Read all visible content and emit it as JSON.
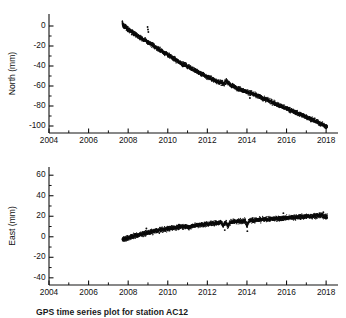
{
  "figure": {
    "caption": "GPS time series plot for station AC12",
    "background": "#ffffff",
    "point_color": "#0d0d0d"
  },
  "chart_data": [
    {
      "type": "scatter",
      "panel_name": "north",
      "title": "",
      "xlabel": "",
      "ylabel": "North (mm)",
      "xlim": [
        2004,
        2018.6
      ],
      "ylim": [
        -107,
        12
      ],
      "grid": false,
      "legend": "none",
      "xticks": [
        2004,
        2006,
        2008,
        2010,
        2012,
        2014,
        2016,
        2018
      ],
      "xtick_labels": [
        "2004",
        "2006",
        "2008",
        "2010",
        "2012",
        "2014",
        "2016",
        "2018"
      ],
      "xminor_ticks": [
        2005,
        2007,
        2009,
        2011,
        2013,
        2015,
        2017
      ],
      "yticks": [
        0,
        -20,
        -40,
        -60,
        -80,
        -100
      ],
      "ytick_labels": [
        "0",
        "-20",
        "-40",
        "-60",
        "-80",
        "-100"
      ],
      "yminor_ticks": [
        -10,
        -30,
        -50,
        -70,
        -90
      ],
      "series": [
        {
          "name": "North displacement",
          "x": [
            2007.7,
            2007.74,
            2007.78,
            2007.82,
            2007.86,
            2007.9,
            2007.94,
            2007.98,
            2008.02,
            2008.1,
            2008.18,
            2008.26,
            2008.34,
            2008.42,
            2008.5,
            2008.58,
            2008.66,
            2008.74,
            2008.82,
            2008.9,
            2008.98,
            2009.06,
            2009.14,
            2009.22,
            2009.3,
            2009.38,
            2009.46,
            2009.54,
            2009.62,
            2009.7,
            2009.78,
            2009.86,
            2009.94,
            2010.02,
            2010.1,
            2010.18,
            2010.26,
            2010.34,
            2010.42,
            2010.5,
            2010.58,
            2010.66,
            2010.74,
            2010.82,
            2010.9,
            2010.98,
            2011.06,
            2011.14,
            2011.22,
            2011.3,
            2011.38,
            2011.46,
            2011.54,
            2011.62,
            2011.7,
            2011.78,
            2011.86,
            2011.94,
            2012.02,
            2012.1,
            2012.18,
            2012.26,
            2012.34,
            2012.42,
            2012.5,
            2012.58,
            2012.66,
            2012.74,
            2012.82,
            2012.9,
            2012.98,
            2013.06,
            2013.14,
            2013.22,
            2013.3,
            2013.38,
            2013.46,
            2013.54,
            2013.62,
            2013.7,
            2013.78,
            2013.86,
            2013.94,
            2014.02,
            2014.1,
            2014.18,
            2014.26,
            2014.34,
            2014.42,
            2014.5,
            2014.58,
            2014.66,
            2014.74,
            2014.82,
            2014.9,
            2014.98,
            2015.06,
            2015.14,
            2015.22,
            2015.3,
            2015.38,
            2015.46,
            2015.54,
            2015.62,
            2015.7,
            2015.78,
            2015.86,
            2015.94,
            2016.02,
            2016.1,
            2016.18,
            2016.26,
            2016.34,
            2016.42,
            2016.5,
            2016.58,
            2016.66,
            2016.74,
            2016.82,
            2016.9,
            2016.98,
            2017.06,
            2017.14,
            2017.22,
            2017.3,
            2017.38,
            2017.46,
            2017.54,
            2017.62,
            2017.7,
            2017.78,
            2017.86,
            2017.94,
            2018.0,
            2018.06
          ],
          "y": [
            3.0,
            1.0,
            0.5,
            -1.0,
            0.0,
            -1.5,
            -2.0,
            -3.0,
            -3.5,
            -5.0,
            -6.0,
            -7.0,
            -8.0,
            -9.0,
            -10.0,
            -11.0,
            -12.0,
            -13.0,
            -14.0,
            -15.0,
            -16.0,
            -17.0,
            -18.0,
            -19.0,
            -20.0,
            -21.0,
            -22.0,
            -23.0,
            -24.0,
            -25.0,
            -26.0,
            -27.0,
            -28.0,
            -29.0,
            -30.0,
            -31.0,
            -32.0,
            -33.0,
            -34.0,
            -35.0,
            -36.0,
            -37.0,
            -38.0,
            -38.5,
            -39.0,
            -40.0,
            -41.0,
            -41.5,
            -42.5,
            -43.5,
            -44.5,
            -45.5,
            -46.0,
            -47.0,
            -48.0,
            -48.5,
            -49.5,
            -50.5,
            -51.0,
            -51.5,
            -52.5,
            -53.0,
            -54.0,
            -54.5,
            -55.5,
            -56.0,
            -56.5,
            -57.0,
            -58.0,
            -56.0,
            -55.0,
            -57.0,
            -58.5,
            -59.5,
            -60.0,
            -61.0,
            -61.5,
            -62.5,
            -63.0,
            -63.5,
            -64.0,
            -65.0,
            -65.5,
            -66.0,
            -66.5,
            -67.0,
            -67.5,
            -68.5,
            -69.0,
            -69.5,
            -70.0,
            -71.0,
            -71.5,
            -72.5,
            -73.0,
            -73.5,
            -74.0,
            -75.0,
            -75.5,
            -76.5,
            -77.0,
            -78.0,
            -78.5,
            -79.5,
            -80.0,
            -80.5,
            -81.5,
            -82.0,
            -82.5,
            -83.0,
            -84.0,
            -84.5,
            -85.5,
            -86.0,
            -86.5,
            -87.5,
            -88.0,
            -88.5,
            -89.5,
            -90.0,
            -90.5,
            -91.5,
            -92.0,
            -93.0,
            -93.5,
            -94.5,
            -95.0,
            -96.0,
            -96.5,
            -97.5,
            -98.0,
            -99.0,
            -100.0,
            -100.5,
            -101.0
          ],
          "scatter_band_mm": 3.0,
          "outliers": [
            {
              "x": 2008.98,
              "y": -1.0
            },
            {
              "x": 2009.0,
              "y": -3.5
            },
            {
              "x": 2009.02,
              "y": -6.0
            },
            {
              "x": 2014.15,
              "y": -72.0
            }
          ]
        }
      ]
    },
    {
      "type": "scatter",
      "panel_name": "east",
      "title": "",
      "xlabel": "",
      "ylabel": "East (mm)",
      "xlim": [
        2004,
        2018.6
      ],
      "ylim": [
        -47,
        68
      ],
      "grid": false,
      "legend": "none",
      "xticks": [
        2004,
        2006,
        2008,
        2010,
        2012,
        2014,
        2016,
        2018
      ],
      "xtick_labels": [
        "2004",
        "2006",
        "2008",
        "2010",
        "2012",
        "2014",
        "2016",
        "2018"
      ],
      "xminor_ticks": [
        2005,
        2007,
        2009,
        2011,
        2013,
        2015,
        2017
      ],
      "yticks": [
        60,
        40,
        20,
        0,
        -20,
        -40
      ],
      "ytick_labels": [
        "60",
        "40",
        "20",
        "0",
        "-20",
        "-40"
      ],
      "yminor_ticks": [
        50,
        30,
        10,
        -10,
        -30
      ],
      "series": [
        {
          "name": "East displacement",
          "x": [
            2007.7,
            2007.76,
            2007.82,
            2007.88,
            2007.94,
            2008.0,
            2008.08,
            2008.16,
            2008.24,
            2008.32,
            2008.4,
            2008.48,
            2008.56,
            2008.64,
            2008.72,
            2008.8,
            2008.88,
            2008.96,
            2009.04,
            2009.12,
            2009.2,
            2009.28,
            2009.36,
            2009.44,
            2009.52,
            2009.6,
            2009.68,
            2009.76,
            2009.84,
            2009.92,
            2010.0,
            2010.08,
            2010.16,
            2010.24,
            2010.32,
            2010.4,
            2010.48,
            2010.56,
            2010.64,
            2010.72,
            2010.8,
            2010.88,
            2010.96,
            2011.04,
            2011.12,
            2011.2,
            2011.28,
            2011.36,
            2011.44,
            2011.52,
            2011.6,
            2011.68,
            2011.76,
            2011.84,
            2011.92,
            2012.0,
            2012.08,
            2012.16,
            2012.24,
            2012.32,
            2012.4,
            2012.48,
            2012.56,
            2012.64,
            2012.72,
            2012.8,
            2012.88,
            2012.96,
            2013.04,
            2013.12,
            2013.2,
            2013.28,
            2013.36,
            2013.44,
            2013.52,
            2013.6,
            2013.68,
            2013.76,
            2013.84,
            2013.92,
            2014.0,
            2014.08,
            2014.16,
            2014.24,
            2014.32,
            2014.4,
            2014.48,
            2014.56,
            2014.64,
            2014.72,
            2014.8,
            2014.88,
            2014.96,
            2015.04,
            2015.12,
            2015.2,
            2015.28,
            2015.36,
            2015.44,
            2015.52,
            2015.6,
            2015.68,
            2015.76,
            2015.84,
            2015.92,
            2016.0,
            2016.08,
            2016.16,
            2016.24,
            2016.32,
            2016.4,
            2016.48,
            2016.56,
            2016.64,
            2016.72,
            2016.8,
            2016.88,
            2016.96,
            2017.04,
            2017.12,
            2017.2,
            2017.28,
            2017.36,
            2017.44,
            2017.52,
            2017.6,
            2017.68,
            2017.76,
            2017.84,
            2017.92,
            2018.0,
            2018.06
          ],
          "y": [
            -2.0,
            -2.5,
            -1.5,
            -2.0,
            -1.0,
            -1.5,
            -0.5,
            0.0,
            0.5,
            1.0,
            1.5,
            1.5,
            2.0,
            2.5,
            3.0,
            3.0,
            3.5,
            4.0,
            4.0,
            4.5,
            5.0,
            5.0,
            5.5,
            6.0,
            6.0,
            6.5,
            7.0,
            7.0,
            7.5,
            7.5,
            8.0,
            8.0,
            8.5,
            8.5,
            9.0,
            9.0,
            9.0,
            9.5,
            9.5,
            10.0,
            10.0,
            10.0,
            10.5,
            8.5,
            9.5,
            10.5,
            11.0,
            11.0,
            11.0,
            11.5,
            11.5,
            12.0,
            12.0,
            12.0,
            12.5,
            12.5,
            12.5,
            13.0,
            13.0,
            13.0,
            13.5,
            13.5,
            13.5,
            14.0,
            14.0,
            11.0,
            13.0,
            14.0,
            10.0,
            13.5,
            14.5,
            14.5,
            15.0,
            15.0,
            15.0,
            15.0,
            15.5,
            15.5,
            15.5,
            15.5,
            11.0,
            15.0,
            16.0,
            16.0,
            16.0,
            16.0,
            16.5,
            16.5,
            16.5,
            16.5,
            17.0,
            17.0,
            17.0,
            17.0,
            17.0,
            17.5,
            17.5,
            17.5,
            17.5,
            18.0,
            18.0,
            18.0,
            18.0,
            18.0,
            18.5,
            18.5,
            18.5,
            18.5,
            19.0,
            19.0,
            19.0,
            19.0,
            19.0,
            19.5,
            19.5,
            19.5,
            19.5,
            20.0,
            20.0,
            20.0,
            20.0,
            20.0,
            20.5,
            20.5,
            20.5,
            20.5,
            21.0,
            21.0,
            20.0,
            20.0,
            19.5,
            19.5
          ],
          "scatter_band_mm": 3.0,
          "outliers": [
            {
              "x": 2008.92,
              "y": 8.0
            },
            {
              "x": 2012.88,
              "y": 6.5
            },
            {
              "x": 2014.02,
              "y": 5.5
            },
            {
              "x": 2015.84,
              "y": 23.0
            },
            {
              "x": 2017.86,
              "y": 24.0
            }
          ]
        }
      ]
    }
  ]
}
